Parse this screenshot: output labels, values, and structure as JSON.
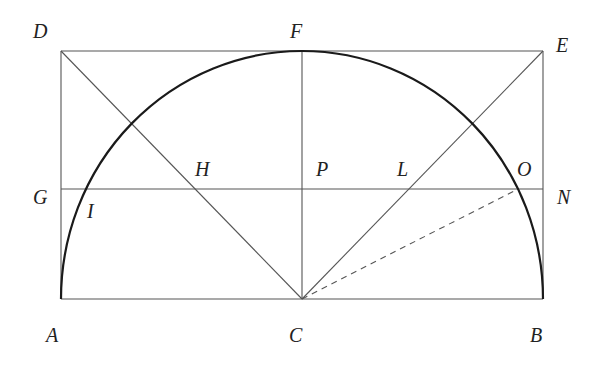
{
  "diagram": {
    "colors": {
      "line": "#555555",
      "arc": "#1a1a1a",
      "label": "#222222",
      "background": "#ffffff"
    },
    "points": {
      "A": {
        "label": "A",
        "x": 61,
        "y": 299
      },
      "B": {
        "label": "B",
        "x": 543,
        "y": 299
      },
      "C": {
        "label": "C",
        "x": 302,
        "y": 299
      },
      "D": {
        "label": "D",
        "x": 61,
        "y": 51
      },
      "E": {
        "label": "E",
        "x": 543,
        "y": 51
      },
      "F": {
        "label": "F",
        "x": 302,
        "y": 51
      },
      "G": {
        "label": "G",
        "x": 61,
        "y": 189
      },
      "N": {
        "label": "N",
        "x": 543,
        "y": 189
      },
      "H": {
        "label": "H",
        "x": 192,
        "y": 189
      },
      "P": {
        "label": "P",
        "x": 302,
        "y": 189
      },
      "L": {
        "label": "L",
        "x": 412,
        "y": 189
      },
      "O": {
        "label": "O",
        "x": 518,
        "y": 189
      },
      "I": {
        "label": "I",
        "x": 86,
        "y": 189
      }
    },
    "labels": [
      {
        "id": "D",
        "text": "D",
        "x": 33,
        "y": 38
      },
      {
        "id": "F",
        "text": "F",
        "x": 290,
        "y": 38
      },
      {
        "id": "E",
        "text": "E",
        "x": 556,
        "y": 52
      },
      {
        "id": "G",
        "text": "G",
        "x": 33,
        "y": 204
      },
      {
        "id": "I",
        "text": "I",
        "x": 87,
        "y": 218
      },
      {
        "id": "H",
        "text": "H",
        "x": 195,
        "y": 176
      },
      {
        "id": "P",
        "text": "P",
        "x": 316,
        "y": 176
      },
      {
        "id": "L",
        "text": "L",
        "x": 397,
        "y": 176
      },
      {
        "id": "O",
        "text": "O",
        "x": 517,
        "y": 176
      },
      {
        "id": "N",
        "text": "N",
        "x": 557,
        "y": 204
      },
      {
        "id": "A",
        "text": "A",
        "x": 46,
        "y": 342
      },
      {
        "id": "C",
        "text": "C",
        "x": 289,
        "y": 342
      },
      {
        "id": "B",
        "text": "B",
        "x": 530,
        "y": 342
      }
    ],
    "segments": [
      {
        "name": "DE",
        "style": "solid"
      },
      {
        "name": "AB",
        "style": "solid"
      },
      {
        "name": "DA",
        "style": "solid"
      },
      {
        "name": "EB",
        "style": "solid"
      },
      {
        "name": "GN",
        "style": "solid"
      },
      {
        "name": "FC",
        "style": "solid"
      },
      {
        "name": "DC",
        "style": "solid"
      },
      {
        "name": "EC",
        "style": "solid"
      },
      {
        "name": "CO",
        "style": "dashed"
      }
    ],
    "arc": {
      "name": "semicircle AFB",
      "center": "C",
      "rx": 241,
      "ry": 248
    }
  }
}
